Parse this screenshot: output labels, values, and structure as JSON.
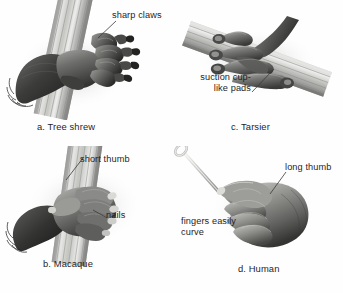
{
  "figure": {
    "background_color": "#ffffff",
    "text_color": "#1f1f1f",
    "leader_line_color": "#3a3a3a"
  },
  "panels": [
    {
      "id": "tree-shrew",
      "caption": "a. Tree shrew",
      "subject": "tree shrew paw gripping a branch",
      "callouts": [
        {
          "id": "sharp-claws",
          "text": "sharp claws"
        }
      ]
    },
    {
      "id": "tarsier",
      "caption": "c. Tarsier",
      "subject": "tarsier hand gripping a branch",
      "callouts": [
        {
          "id": "suction-cup-like-pads",
          "text": "suction cup-\nlike pads"
        }
      ]
    },
    {
      "id": "macaque",
      "caption": "b. Macaque",
      "subject": "macaque hand gripping a branch",
      "callouts": [
        {
          "id": "short-thumb",
          "text": "short thumb"
        },
        {
          "id": "nails",
          "text": "nails"
        }
      ]
    },
    {
      "id": "human",
      "caption": "d. Human",
      "subject": "human hand holding a thin tool",
      "callouts": [
        {
          "id": "long-thumb",
          "text": "long thumb"
        },
        {
          "id": "fingers-easily-curve",
          "text": "fingers easily\ncurve"
        }
      ]
    }
  ]
}
